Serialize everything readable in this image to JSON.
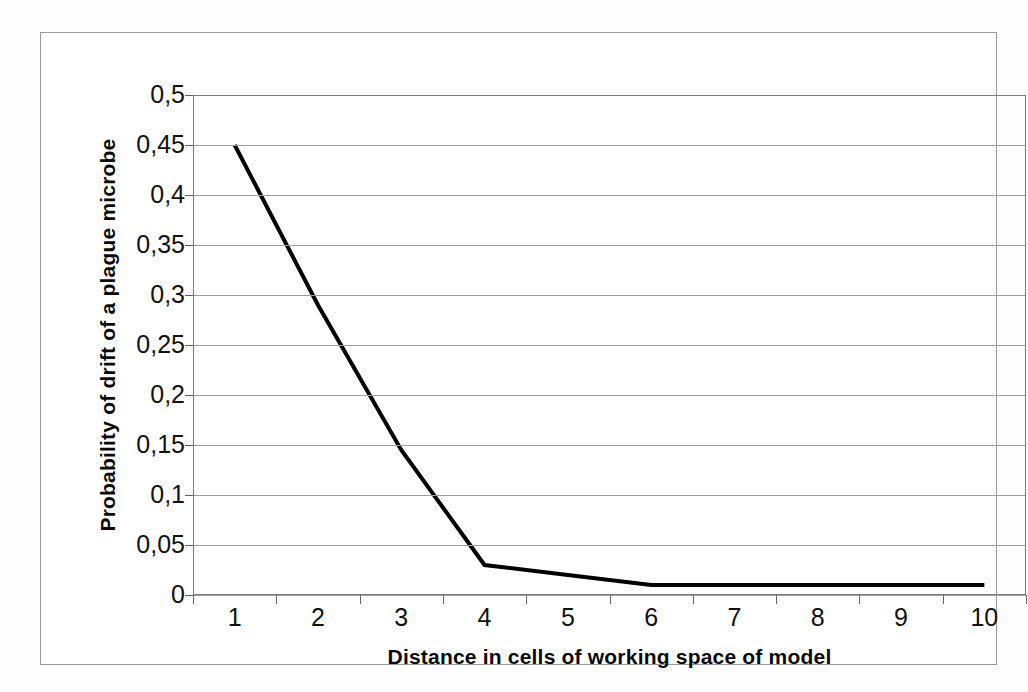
{
  "chart_data": {
    "type": "line",
    "title": "",
    "xlabel": "Distance in cells of working space of model",
    "ylabel": "Probability of drift of a plague microbe",
    "categories": [
      "1",
      "2",
      "3",
      "4",
      "5",
      "6",
      "7",
      "8",
      "9",
      "10"
    ],
    "values": [
      0.45,
      0.29,
      0.145,
      0.03,
      0.02,
      0.01,
      0.01,
      0.01,
      0.01,
      0.01
    ],
    "series": [
      {
        "name": "Probability of drift",
        "values": [
          0.45,
          0.29,
          0.145,
          0.03,
          0.02,
          0.01,
          0.01,
          0.01,
          0.01,
          0.01
        ]
      }
    ],
    "ylim": [
      0,
      0.5
    ],
    "ytick_step": 0.05,
    "ytick_labels": [
      "0,5",
      "0,45",
      "0,4",
      "0,35",
      "0,3",
      "0,25",
      "0,2",
      "0,15",
      "0,1",
      "0,05",
      "0"
    ],
    "ytick_values": [
      0.5,
      0.45,
      0.4,
      0.35,
      0.3,
      0.25,
      0.2,
      0.15,
      0.1,
      0.05,
      0
    ],
    "decimal_separator": ",",
    "grid": "horizontal",
    "legend": "none",
    "line_color": "#000000",
    "line_width": 4,
    "markers": "none",
    "plot_background": "#ffffff",
    "grid_color": "#9d9d9d",
    "axis_color": "#7d7d7d"
  }
}
